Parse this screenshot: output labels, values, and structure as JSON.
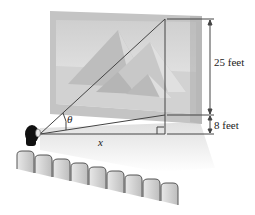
{
  "figure": {
    "labels": {
      "angle": "θ",
      "horizontal_distance": "x",
      "screen_height": "25 feet",
      "screen_elevation": "8 feet"
    },
    "seats": {
      "count": 9
    },
    "screen_image": "pyramids",
    "colors": {
      "line": "#444444",
      "screen_frame": "#b8b8b8",
      "screen_fill": "#d6d6d6",
      "floor_shadow": "#e6e6e6",
      "seat": "#cfcfcf",
      "seat_edge": "#555555",
      "viewer_hair": "#111111"
    }
  }
}
